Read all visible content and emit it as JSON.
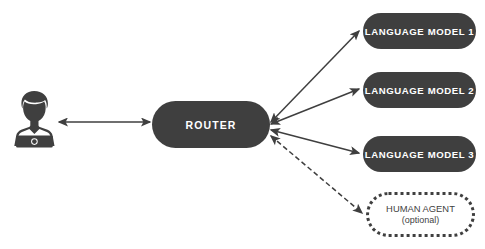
{
  "diagram": {
    "type": "flow-diagram",
    "background_color": "#ffffff",
    "node_fill_color": "#3f3f3f",
    "node_text_color": "#ffffff",
    "edge_color": "#3f3f3f",
    "nodes": {
      "user": {
        "label": "",
        "icon": "user-with-laptop-icon",
        "shape": "icon",
        "x": 8,
        "y": 88,
        "w": 52,
        "h": 64
      },
      "router": {
        "label": "ROUTER",
        "shape": "rounded-pill",
        "style": "solid",
        "x": 152,
        "y": 101,
        "w": 118,
        "h": 47
      },
      "lm1": {
        "label": "LANGUAGE MODEL 1",
        "shape": "rounded-pill",
        "style": "solid",
        "x": 363,
        "y": 13,
        "w": 113,
        "h": 36
      },
      "lm2": {
        "label": "LANGUAGE MODEL 2",
        "shape": "rounded-pill",
        "style": "solid",
        "x": 363,
        "y": 72,
        "w": 113,
        "h": 36
      },
      "lm3": {
        "label": "LANGUAGE MODEL 3",
        "shape": "rounded-pill",
        "style": "solid",
        "x": 363,
        "y": 136,
        "w": 113,
        "h": 36
      },
      "human_agent": {
        "label": "HUMAN AGENT",
        "sublabel": "(optional)",
        "shape": "rounded-pill",
        "style": "dotted-outline",
        "x": 366,
        "y": 192,
        "w": 109,
        "h": 45
      }
    },
    "edges": [
      {
        "name": "user-router",
        "from": "user",
        "to": "router",
        "style": "solid",
        "arrows": "both"
      },
      {
        "name": "router-lm1",
        "from": "router",
        "to": "lm1",
        "style": "solid",
        "arrows": "both"
      },
      {
        "name": "router-lm2",
        "from": "router",
        "to": "lm2",
        "style": "solid",
        "arrows": "both"
      },
      {
        "name": "router-lm3",
        "from": "router",
        "to": "lm3",
        "style": "solid",
        "arrows": "both"
      },
      {
        "name": "router-human",
        "from": "router",
        "to": "human_agent",
        "style": "dashed",
        "arrows": "both"
      }
    ]
  }
}
